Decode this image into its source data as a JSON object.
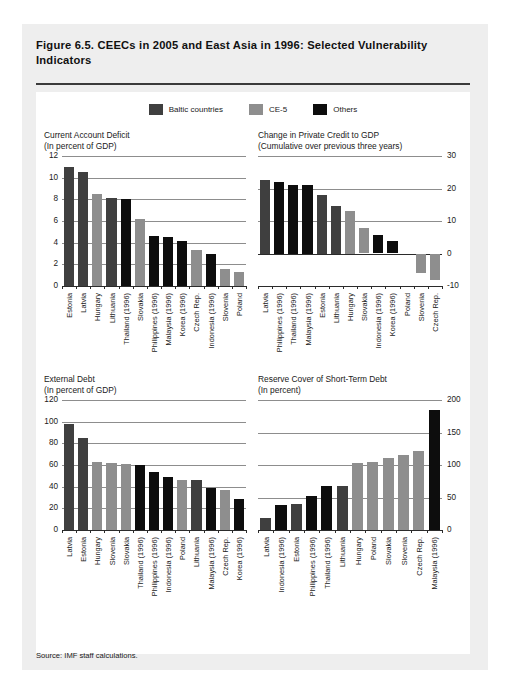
{
  "figure": {
    "title": "Figure 6.5. CEECs in 2005 and East Asia in 1996:\nSelected Vulnerability Indicators",
    "source": "Source: IMF staff calculations."
  },
  "legend": {
    "items": [
      {
        "label": "Baltic countries",
        "color": "#3f3f3f",
        "key": "baltic"
      },
      {
        "label": "CE-5",
        "color": "#8e8e8e",
        "key": "ce5"
      },
      {
        "label": "Others",
        "color": "#0d0d0d",
        "key": "others"
      }
    ]
  },
  "colors": {
    "baltic": "#3f3f3f",
    "ce5": "#8e8e8e",
    "others": "#0d0d0d",
    "grid": "#8d8d8d",
    "axis": "#2b2b2b",
    "card_bg": "#eeeeee",
    "panel_bg": "#ffffff"
  },
  "chart_data": [
    {
      "id": "current-account-deficit",
      "type": "bar",
      "title": "Current Account Deficit\n(In percent of GDP)",
      "xlabel": "",
      "ylabel": "",
      "ylim": [
        0,
        12
      ],
      "yticks": [
        0,
        2,
        4,
        6,
        8,
        10,
        12
      ],
      "ytick_labels": [
        "0",
        "2",
        "4",
        "6",
        "8",
        "10",
        "12"
      ],
      "axis_side": "left",
      "grid": true,
      "categories": [
        "Estonia",
        "Latvia",
        "Hungary",
        "Lithuania",
        "Thailand (1996)",
        "Slovakia",
        "Philippines (1996)",
        "Malaysia (1996)",
        "Korea (1996)",
        "Czech Rep.",
        "Indonesia (1996)",
        "Slovenia",
        "Poland"
      ],
      "values": [
        11.0,
        10.5,
        8.5,
        8.1,
        8.0,
        6.2,
        4.6,
        4.5,
        4.2,
        3.3,
        3.0,
        1.6,
        1.3
      ],
      "groups": [
        "baltic",
        "baltic",
        "ce5",
        "baltic",
        "others",
        "ce5",
        "others",
        "others",
        "others",
        "ce5",
        "others",
        "ce5",
        "ce5"
      ]
    },
    {
      "id": "change-private-credit-to-gdp",
      "type": "bar",
      "title": "Change in Private Credit to GDP\n(Cumulative over previous three years)",
      "xlabel": "",
      "ylabel": "",
      "ylim": [
        -10,
        30
      ],
      "yticks": [
        -10,
        0,
        10,
        20,
        30
      ],
      "ytick_labels": [
        "-10",
        "0",
        "10",
        "20",
        "30"
      ],
      "axis_side": "right",
      "grid": true,
      "categories": [
        "Latvia",
        "Philippines (1996)",
        "Thailand (1996)",
        "Malaysia (1996)",
        "Estonia",
        "Lithuania",
        "Hungary",
        "Slovakia",
        "Indonesia (1996)",
        "Korea (1996)",
        "Poland",
        "Slovenia",
        "Czech Rep."
      ],
      "values": [
        22.5,
        22.0,
        21.0,
        21.0,
        18.0,
        14.5,
        13.0,
        7.8,
        5.8,
        3.7,
        0.0,
        -6.0,
        -8.0
      ],
      "groups": [
        "baltic",
        "others",
        "others",
        "others",
        "baltic",
        "baltic",
        "ce5",
        "ce5",
        "others",
        "others",
        "ce5",
        "ce5",
        "ce5"
      ]
    },
    {
      "id": "external-debt",
      "type": "bar",
      "title": "External Debt\n(In percent of GDP)",
      "xlabel": "",
      "ylabel": "",
      "ylim": [
        0,
        120
      ],
      "yticks": [
        0,
        20,
        40,
        60,
        80,
        100,
        120
      ],
      "ytick_labels": [
        "0",
        "20",
        "40",
        "60",
        "80",
        "100",
        "120"
      ],
      "axis_side": "left",
      "grid": true,
      "categories": [
        "Latvia",
        "Estonia",
        "Hungary",
        "Slovenia",
        "Slovakia",
        "Thailand (1996)",
        "Philippines (1996)",
        "Indonesia (1996)",
        "Poland",
        "Lithuania",
        "Malaysia (1996)",
        "Czech Rep.",
        "Korea (1996)"
      ],
      "values": [
        98,
        85,
        63,
        62,
        61,
        60,
        54,
        49,
        46,
        46,
        39,
        37,
        29
      ],
      "groups": [
        "baltic",
        "baltic",
        "ce5",
        "ce5",
        "ce5",
        "others",
        "others",
        "others",
        "ce5",
        "baltic",
        "others",
        "ce5",
        "others"
      ]
    },
    {
      "id": "reserve-cover-short-term-debt",
      "type": "bar",
      "title": "Reserve Cover of Short-Term Debt\n(In percent)",
      "xlabel": "",
      "ylabel": "",
      "ylim": [
        0,
        200
      ],
      "yticks": [
        0,
        50,
        100,
        150,
        200
      ],
      "ytick_labels": [
        "0",
        "50",
        "100",
        "150",
        "200"
      ],
      "axis_side": "right",
      "grid": true,
      "categories": [
        "Latvia",
        "Indonesia (1996)",
        "Estonia",
        "Philippines (1996)",
        "Thailand (1996)",
        "Lithuania",
        "Hungary",
        "Poland",
        "Slovakia",
        "Slovenia",
        "Czech Rep.",
        "Malaysia (1996)"
      ],
      "values": [
        18,
        38,
        40,
        52,
        68,
        68,
        103,
        105,
        111,
        116,
        121,
        185
      ],
      "groups": [
        "baltic",
        "others",
        "baltic",
        "others",
        "others",
        "baltic",
        "ce5",
        "ce5",
        "ce5",
        "ce5",
        "ce5",
        "others"
      ]
    }
  ]
}
